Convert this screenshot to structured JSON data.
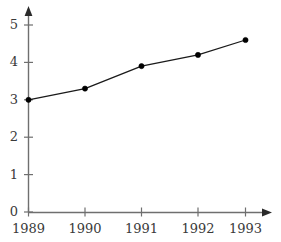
{
  "chart_data": {
    "type": "line",
    "title": "",
    "subtitle": "",
    "xlabel": "",
    "ylabel": "",
    "categories": [
      "1989",
      "1990",
      "1991",
      "1992",
      "1993"
    ],
    "x": [
      1989,
      1990,
      1991,
      1992,
      1993
    ],
    "values": [
      3.0,
      3.3,
      3.9,
      4.2,
      4.6
    ],
    "series": [
      {
        "name": "",
        "values": [
          3.0,
          3.3,
          3.9,
          4.2,
          4.6
        ]
      }
    ],
    "xtick_labels": [
      "1989",
      "1990",
      "1991",
      "1992",
      "1993"
    ],
    "ytick_labels": [
      "0",
      "1",
      "2",
      "3",
      "4",
      "5"
    ],
    "ytick_values": [
      0,
      1,
      2,
      3,
      4,
      5
    ],
    "ylim": [
      0,
      5.45
    ],
    "xlim": [
      1988.72,
      1993.55
    ],
    "grid": false,
    "legend": null,
    "legend_position": "none",
    "annotations": [],
    "marker": "filled-circle",
    "line_color": "#1a1a1a",
    "marker_color": "#000000",
    "axis_color": "#6f6f6f",
    "background_color": "#ffffff",
    "axis_style": "arrow-tipped-l-shape"
  },
  "axes": {
    "y_ticks": [
      {
        "label": "5",
        "value": 5
      },
      {
        "label": "4",
        "value": 4
      },
      {
        "label": "3",
        "value": 3
      },
      {
        "label": "2",
        "value": 2
      },
      {
        "label": "1",
        "value": 1
      },
      {
        "label": "0",
        "value": 0
      }
    ],
    "x_ticks": [
      {
        "label": "1989",
        "value": 1989
      },
      {
        "label": "1990",
        "value": 1990
      },
      {
        "label": "1991",
        "value": 1991
      },
      {
        "label": "1992",
        "value": 1992
      },
      {
        "label": "1993",
        "value": 1993
      }
    ]
  }
}
